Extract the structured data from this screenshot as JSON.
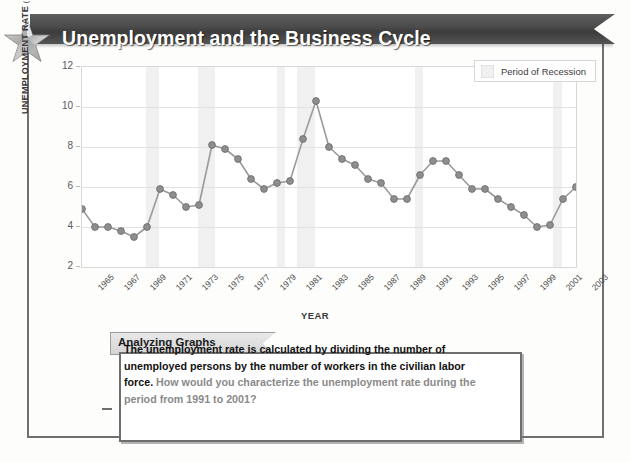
{
  "banner": {
    "title": "Unemployment and the Business Cycle",
    "star_icon": "star-icon",
    "bg_color": "#4b4b4b",
    "text_color": "#ffffff"
  },
  "legend": {
    "label": "Period of Recession",
    "swatch_color": "#f0f0f0",
    "position": "top-right"
  },
  "caption": {
    "tab_label": "Analyzing Graphs",
    "statement": "The unemployment rate is calculated by dividing the number of unemployed persons by the number of workers in the civilian labor force.",
    "question": "How would you characterize the unemployment rate during the period from 1991 to 2001?",
    "statement_color": "#111111",
    "question_color": "#8a8a8a"
  },
  "chart_data": {
    "type": "line",
    "title": "Unemployment and the Business Cycle",
    "xlabel": "YEAR",
    "ylabel": "UNEMPLOYMENT RATE (percentage)",
    "ylabel_main": "UNEMPLOYMENT RATE",
    "ylabel_sub": "(percentage)",
    "ylim": [
      2,
      12
    ],
    "xlim": [
      1965,
      2003
    ],
    "yticks": [
      2,
      4,
      6,
      8,
      10,
      12
    ],
    "xticks": [
      1965,
      1967,
      1969,
      1971,
      1973,
      1975,
      1977,
      1979,
      1981,
      1983,
      1985,
      1987,
      1989,
      1991,
      1993,
      1995,
      1997,
      1999,
      2001,
      2003
    ],
    "grid": true,
    "legend_position": "top-right",
    "marker": "circle",
    "line_color": "#9a9a9a",
    "marker_color": "#8e8e8e",
    "x": [
      1965,
      1966,
      1967,
      1968,
      1969,
      1970,
      1971,
      1972,
      1973,
      1974,
      1975,
      1976,
      1977,
      1978,
      1979,
      1980,
      1981,
      1982,
      1983,
      1984,
      1985,
      1986,
      1987,
      1988,
      1989,
      1990,
      1991,
      1992,
      1993,
      1994,
      1995,
      1996,
      1997,
      1998,
      1999,
      2000,
      2001,
      2002,
      2003
    ],
    "values": [
      4.9,
      4.0,
      4.0,
      3.8,
      3.5,
      4.0,
      5.9,
      5.6,
      5.0,
      5.1,
      8.1,
      7.9,
      7.4,
      6.4,
      5.9,
      6.2,
      6.3,
      8.4,
      10.3,
      8.0,
      7.4,
      7.1,
      6.4,
      6.2,
      5.4,
      5.4,
      6.6,
      7.3,
      7.3,
      6.6,
      5.9,
      5.9,
      5.4,
      5.0,
      4.6,
      4.0,
      4.1,
      5.4,
      6.0
    ],
    "series_name": "Unemployment rate",
    "recession_bands": [
      {
        "start": 1969.9,
        "end": 1970.9
      },
      {
        "start": 1973.9,
        "end": 1975.2
      },
      {
        "start": 1980.0,
        "end": 1980.6
      },
      {
        "start": 1981.5,
        "end": 1982.9
      },
      {
        "start": 1990.6,
        "end": 1991.2
      },
      {
        "start": 2001.2,
        "end": 2001.9
      }
    ]
  }
}
